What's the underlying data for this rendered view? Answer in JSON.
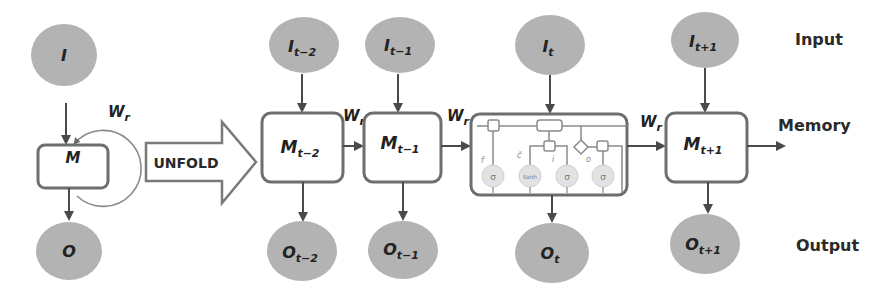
{
  "diagram": {
    "colors": {
      "node_fill": "#b3b3b3",
      "box_stroke": "#6e6e6e",
      "arrow": "#4a4a4a",
      "text": "#222222"
    },
    "folded": {
      "input": {
        "base": "I",
        "sub": ""
      },
      "memory": {
        "base": "M",
        "sub": ""
      },
      "output": {
        "base": "O",
        "sub": ""
      },
      "recurrent_weight": {
        "base": "W",
        "sub": "r"
      }
    },
    "unfold_label": "UNFOLD",
    "steps": [
      {
        "input": {
          "base": "I",
          "sub": "t−2"
        },
        "memory": {
          "base": "M",
          "sub": "t−2"
        },
        "output": {
          "base": "O",
          "sub": "t−2"
        }
      },
      {
        "input": {
          "base": "I",
          "sub": "t−1"
        },
        "memory": {
          "base": "M",
          "sub": "t−1"
        },
        "output": {
          "base": "O",
          "sub": "t−1"
        }
      },
      {
        "input": {
          "base": "I",
          "sub": "t"
        },
        "memory": {
          "base": "LSTM cell",
          "sub": ""
        },
        "output": {
          "base": "O",
          "sub": "t"
        }
      },
      {
        "input": {
          "base": "I",
          "sub": "t+1"
        },
        "memory": {
          "base": "M",
          "sub": "t+1"
        },
        "output": {
          "base": "O",
          "sub": "t+1"
        }
      }
    ],
    "weights": [
      {
        "base": "W",
        "sub": "r"
      },
      {
        "base": "W",
        "sub": "r"
      },
      {
        "base": "W",
        "sub": "r"
      }
    ],
    "lstm_cell": {
      "gate_labels": [
        "f",
        "c̃",
        "i",
        "o"
      ],
      "activations": [
        "σ",
        "tanh",
        "σ",
        "σ"
      ]
    },
    "row_labels": {
      "input": "Input",
      "memory": "Memory",
      "output": "Output"
    }
  }
}
